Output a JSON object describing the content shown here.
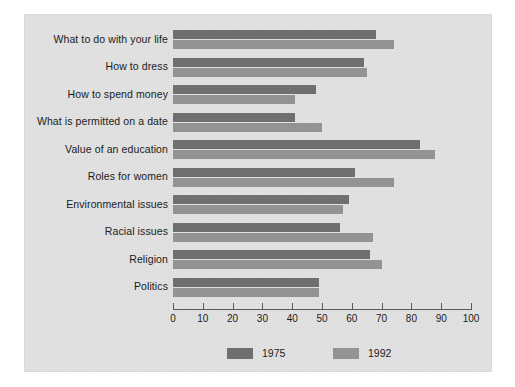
{
  "chart_data": {
    "type": "bar",
    "orientation": "horizontal",
    "title": "",
    "subtitle": "",
    "xlabel": "",
    "ylabel": "",
    "xlim": [
      0,
      100
    ],
    "xticks": [
      "0",
      "10",
      "20",
      "30",
      "40",
      "50",
      "60",
      "70",
      "80",
      "90",
      "100"
    ],
    "grid": false,
    "legend_position": "bottom",
    "categories": [
      "What to do with your life",
      "How to dress",
      "How to spend money",
      "What is permitted on a date",
      "Value of an education",
      "Roles for women",
      "Environmental issues",
      "Racial issues",
      "Religion",
      "Politics"
    ],
    "series": [
      {
        "name": "1975",
        "color": "#6f6f6f",
        "values": [
          68,
          64,
          48,
          41,
          83,
          61,
          59,
          56,
          66,
          49
        ]
      },
      {
        "name": "1992",
        "color": "#939393",
        "values": [
          74,
          65,
          41,
          50,
          88,
          74,
          57,
          67,
          70,
          49
        ]
      }
    ]
  },
  "legend": {
    "items": [
      {
        "label": "1975",
        "color": "#6f6f6f"
      },
      {
        "label": "1992",
        "color": "#939393"
      }
    ]
  },
  "colors": {
    "plate_background": "#e2e2e2",
    "page_background": "#ffffff",
    "axis": "#5a5a5a",
    "text": "#1b1b1b",
    "series_1975": "#6f6f6f",
    "series_1992": "#939393"
  }
}
